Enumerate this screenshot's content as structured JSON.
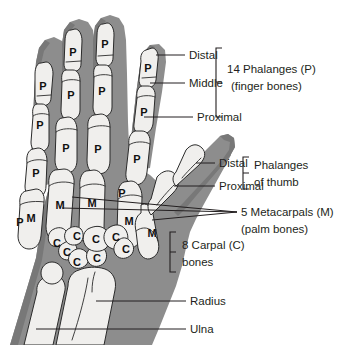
{
  "figure": {
    "background_color": "#ffffff",
    "bone_fill_color": "#f0efed",
    "soft_tissue_color": "#8d8d8d",
    "outline_color": "#2b2b2b",
    "text_color": "#231f20"
  },
  "labels": {
    "distal_finger": "Distal",
    "middle_finger": "Middle",
    "proximal_finger": "Proximal",
    "phalanges_group_line1": "14 Phalanges (P)",
    "phalanges_group_line2": "(finger bones)",
    "distal_thumb": "Distal",
    "proximal_thumb": "Proximal",
    "thumb_group_line1": "Phalanges",
    "thumb_group_line2": "of thumb",
    "metacarpals_line1": "5 Metacarpals (M)",
    "metacarpals_line2": "(palm bones)",
    "carpals_line1": "8 Carpal (C)",
    "carpals_line2": "bones",
    "radius": "Radius",
    "ulna": "Ulna"
  },
  "bone_markers": {
    "phalanx": "P",
    "metacarpal": "M",
    "carpal": "C"
  },
  "phalanx_markers": [
    {
      "x": 108,
      "y": 46
    },
    {
      "x": 65,
      "y": 75
    },
    {
      "x": 37,
      "y": 111
    },
    {
      "x": 72,
      "y": 139
    },
    {
      "x": 150,
      "y": 36
    },
    {
      "x": 142,
      "y": 88
    },
    {
      "x": 130,
      "y": 136
    },
    {
      "x": 103,
      "y": 75
    },
    {
      "x": 99,
      "y": 123
    },
    {
      "x": 72,
      "y": 163
    },
    {
      "x": 46,
      "y": 155
    },
    {
      "x": 138,
      "y": 133
    },
    {
      "x": 58,
      "y": 136
    },
    {
      "x": 48,
      "y": 148
    }
  ],
  "metacarpal_markers": [
    {
      "x": 54,
      "y": 172
    },
    {
      "x": 72,
      "y": 162
    },
    {
      "x": 103,
      "y": 150
    },
    {
      "x": 120,
      "y": 219
    },
    {
      "x": 143,
      "y": 228
    }
  ],
  "carpal_markers": [
    {
      "x": 63,
      "y": 237
    },
    {
      "x": 72,
      "y": 247
    },
    {
      "x": 80,
      "y": 258
    },
    {
      "x": 98,
      "y": 256
    },
    {
      "x": 100,
      "y": 238
    },
    {
      "x": 119,
      "y": 236
    },
    {
      "x": 126,
      "y": 247
    },
    {
      "x": 79,
      "y": 237
    }
  ]
}
